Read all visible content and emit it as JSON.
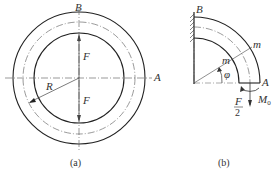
{
  "figure_a": {
    "caption": "(a)",
    "labels": {
      "top": "B",
      "right": "A",
      "force_top": "F",
      "force_bottom": "F",
      "radius": "R"
    }
  },
  "figure_b": {
    "caption": "(b)",
    "labels": {
      "fixed_end": "B",
      "free_end": "A",
      "section_outer": "m",
      "section_inner": "m",
      "angle": "φ",
      "moment": "M",
      "moment_sub": "0",
      "force_num": "F",
      "force_den": "2"
    }
  }
}
